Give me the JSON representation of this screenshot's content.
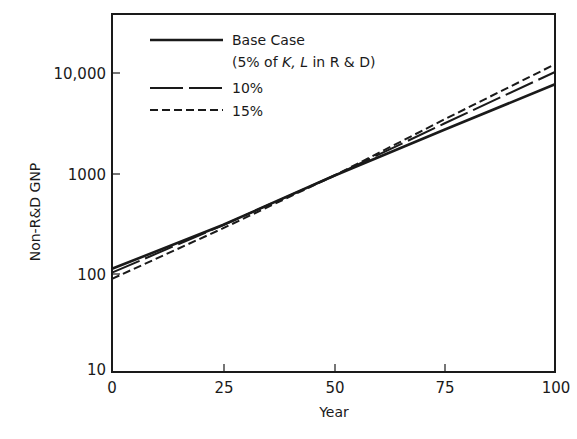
{
  "chart_data": {
    "type": "line",
    "title": "",
    "xlabel": "Year",
    "ylabel": "Non-R&D GNP",
    "xlim": [
      0,
      100
    ],
    "ylim": [
      10,
      40000
    ],
    "yscale": "log",
    "grid": false,
    "legend_position": "upper-left",
    "x_ticks": [
      "0",
      "25",
      "50",
      "75",
      "100"
    ],
    "y_ticks": [
      "10",
      "100",
      "1000",
      "10,000"
    ],
    "x": [
      0,
      25,
      50,
      75,
      100
    ],
    "series": [
      {
        "name": "Base Case (5% of K,L in R&D)",
        "style": "solid",
        "values": [
          107,
          292,
          900,
          2600,
          7400
        ]
      },
      {
        "name": "10%",
        "style": "long-dash",
        "values": [
          98,
          290,
          900,
          3000,
          9800
        ]
      },
      {
        "name": "15%",
        "style": "short-dash",
        "values": [
          85,
          270,
          900,
          3300,
          11700
        ]
      }
    ]
  },
  "legend": {
    "base_line1": "Base Case",
    "base_line2_pre": "(5% of ",
    "base_line2_vars": "K, L",
    "base_line2_post": " in R & D)",
    "ten": "10%",
    "fifteen": "15%"
  },
  "axes": {
    "xlabel": "Year",
    "ylabel": "Non-R&D GNP",
    "x_ticks": [
      "0",
      "25",
      "50",
      "75",
      "100"
    ],
    "y_ticks": [
      "10",
      "100",
      "1000",
      "10,000"
    ]
  }
}
